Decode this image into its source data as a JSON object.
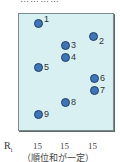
{
  "top_text_cut": "…………",
  "points": [
    {
      "id": "1",
      "x": 38,
      "y": 23
    },
    {
      "id": "2",
      "x": 93,
      "y": 36
    },
    {
      "id": "3",
      "x": 65,
      "y": 45
    },
    {
      "id": "4",
      "x": 65,
      "y": 57
    },
    {
      "id": "5",
      "x": 38,
      "y": 67
    },
    {
      "id": "6",
      "x": 94,
      "y": 78
    },
    {
      "id": "7",
      "x": 94,
      "y": 90
    },
    {
      "id": "8",
      "x": 65,
      "y": 102
    },
    {
      "id": "9",
      "x": 38,
      "y": 114
    }
  ],
  "row_label": "R",
  "row_label_sub": "i",
  "rank_sums": [
    "15",
    "15",
    "15"
  ],
  "caption": "（順位和が一定）",
  "colors": {
    "panel": "#d8f0f2",
    "dot": "#3f74b5",
    "border": "#7d8a8c"
  }
}
